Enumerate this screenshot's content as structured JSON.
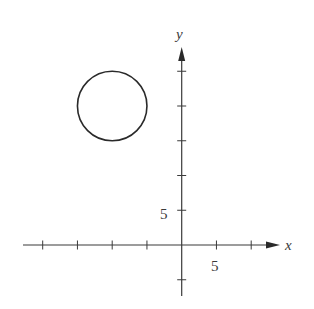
{
  "chart_data": {
    "type": "scatter",
    "title": "",
    "xlabel": "x",
    "ylabel": "y",
    "xlim": [
      -22,
      13
    ],
    "ylim": [
      -9,
      27
    ],
    "grid": false,
    "x_ticks": [
      -20,
      -15,
      -10,
      -5,
      5,
      10
    ],
    "y_ticks": [
      -5,
      5,
      10,
      15,
      20,
      25
    ],
    "x_tick_labels": [
      {
        "value": 5,
        "text": "5"
      }
    ],
    "y_tick_labels": [
      {
        "value": 5,
        "text": "5"
      }
    ],
    "shapes": [
      {
        "kind": "circle",
        "center": [
          -10,
          20
        ],
        "radius": 5
      }
    ],
    "series": []
  }
}
